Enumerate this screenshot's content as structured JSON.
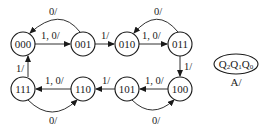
{
  "diagram": {
    "type": "state-transition-diagram",
    "states": [
      {
        "id": "000",
        "label": "000"
      },
      {
        "id": "001",
        "label": "001"
      },
      {
        "id": "010",
        "label": "010"
      },
      {
        "id": "011",
        "label": "011"
      },
      {
        "id": "100",
        "label": "100"
      },
      {
        "id": "101",
        "label": "101"
      },
      {
        "id": "110",
        "label": "110"
      },
      {
        "id": "111",
        "label": "111"
      }
    ],
    "transitions": [
      {
        "from": "000",
        "to": "001",
        "label": "1, 0/"
      },
      {
        "from": "001",
        "to": "000",
        "label": "0/"
      },
      {
        "from": "001",
        "to": "010",
        "label": "1/"
      },
      {
        "from": "010",
        "to": "011",
        "label": "1, 0/"
      },
      {
        "from": "011",
        "to": "010",
        "label": "0/"
      },
      {
        "from": "011",
        "to": "100",
        "label": "1/"
      },
      {
        "from": "100",
        "to": "101",
        "label": "1, 0/"
      },
      {
        "from": "101",
        "to": "100",
        "label": "0/"
      },
      {
        "from": "101",
        "to": "110",
        "label": "1/"
      },
      {
        "from": "110",
        "to": "111",
        "label": "1, 0/"
      },
      {
        "from": "111",
        "to": "110",
        "label": "0/"
      },
      {
        "from": "111",
        "to": "000",
        "label": "1/"
      }
    ],
    "legend": {
      "state_vars": [
        "Q",
        "2",
        "Q",
        "1",
        "Q",
        "0"
      ],
      "output": "A/"
    }
  }
}
